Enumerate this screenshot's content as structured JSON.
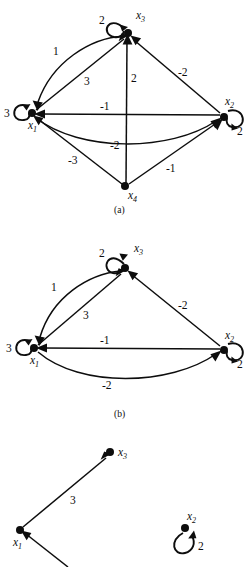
{
  "figure": {
    "background_color": "#ffffff",
    "ink_color": "#0d0d0d",
    "panels": [
      {
        "id": "a",
        "caption": "(a)",
        "nodes": [
          {
            "id": "x1",
            "label": "x",
            "sub": "1",
            "x": 32,
            "y": 113,
            "self_loop_weight": "3"
          },
          {
            "id": "x2",
            "label": "x",
            "sub": "2",
            "x": 224,
            "y": 117,
            "self_loop_weight": "2"
          },
          {
            "id": "x3",
            "label": "x",
            "sub": "3",
            "x": 128,
            "y": 33,
            "self_loop_weight": "2"
          },
          {
            "id": "x4",
            "label": "x",
            "sub": "4",
            "x": 125,
            "y": 186,
            "self_loop_weight": ""
          }
        ],
        "edges": [
          {
            "from": "x3",
            "to": "x1",
            "weight": "1",
            "style": "curved"
          },
          {
            "from": "x1",
            "to": "x3",
            "weight": "3",
            "style": "straight"
          },
          {
            "from": "x4",
            "to": "x3",
            "weight": "2",
            "style": "straight"
          },
          {
            "from": "x2",
            "to": "x3",
            "weight": "-2",
            "style": "straight"
          },
          {
            "from": "x2",
            "to": "x1",
            "weight": "-1",
            "style": "straight"
          },
          {
            "from": "x1",
            "to": "x2",
            "weight": "-2",
            "style": "curved"
          },
          {
            "from": "x4",
            "to": "x1",
            "weight": "-3",
            "style": "straight"
          },
          {
            "from": "x4",
            "to": "x2",
            "weight": "-1",
            "style": "straight"
          }
        ]
      },
      {
        "id": "b",
        "caption": "(b)",
        "nodes": [
          {
            "id": "x1",
            "label": "x",
            "sub": "1",
            "x": 34,
            "y": 348,
            "self_loop_weight": "3"
          },
          {
            "id": "x2",
            "label": "x",
            "sub": "2",
            "x": 224,
            "y": 350,
            "self_loop_weight": "2"
          },
          {
            "id": "x3",
            "label": "x",
            "sub": "3",
            "x": 125,
            "y": 268,
            "self_loop_weight": "2"
          }
        ],
        "edges": [
          {
            "from": "x3",
            "to": "x1",
            "weight": "1",
            "style": "curved"
          },
          {
            "from": "x1",
            "to": "x3",
            "weight": "3",
            "style": "straight"
          },
          {
            "from": "x2",
            "to": "x3",
            "weight": "-2",
            "style": "straight"
          },
          {
            "from": "x2",
            "to": "x1",
            "weight": "-1",
            "style": "straight"
          },
          {
            "from": "x1",
            "to": "x2",
            "weight": "-2",
            "style": "curved"
          }
        ]
      },
      {
        "id": "c",
        "caption": "",
        "nodes": [
          {
            "id": "x1",
            "label": "x",
            "sub": "1",
            "x": 20,
            "y": 530,
            "self_loop_weight": ""
          },
          {
            "id": "x2",
            "label": "x",
            "sub": "2",
            "x": 185,
            "y": 528,
            "self_loop_weight": "2"
          },
          {
            "id": "x3",
            "label": "x",
            "sub": "3",
            "x": 110,
            "y": 452,
            "self_loop_weight": ""
          }
        ],
        "edges": [
          {
            "from": "x1",
            "to": "x3",
            "weight": "3",
            "style": "straight"
          }
        ]
      }
    ]
  },
  "labels": {
    "panel_a": {
      "x1": "x",
      "x1_sub": "1",
      "x2": "x",
      "x2_sub": "2",
      "x3": "x",
      "x3_sub": "3",
      "x4": "x",
      "x4_sub": "4",
      "loop_x1": "3",
      "loop_x2": "2",
      "loop_x3": "2",
      "w_x3_x1": "1",
      "w_x1_x3": "3",
      "w_x4_x3": "2",
      "w_x2_x3": "-2",
      "w_x2_x1": "-1",
      "w_x1_x2": "-2",
      "w_x4_x1": "-3",
      "w_x4_x2": "-1",
      "caption": "(a)"
    },
    "panel_b": {
      "x1": "x",
      "x1_sub": "1",
      "x2": "x",
      "x2_sub": "2",
      "x3": "x",
      "x3_sub": "3",
      "loop_x1": "3",
      "loop_x2": "2",
      "loop_x3": "2",
      "w_x3_x1": "1",
      "w_x1_x3": "3",
      "w_x2_x3": "-2",
      "w_x2_x1": "-1",
      "w_x1_x2": "-2",
      "caption": "(b)"
    },
    "panel_c": {
      "x1": "x",
      "x1_sub": "1",
      "x2": "x",
      "x2_sub": "2",
      "x3": "x",
      "x3_sub": "3",
      "loop_x2": "2",
      "w_x1_x3": "3"
    }
  }
}
